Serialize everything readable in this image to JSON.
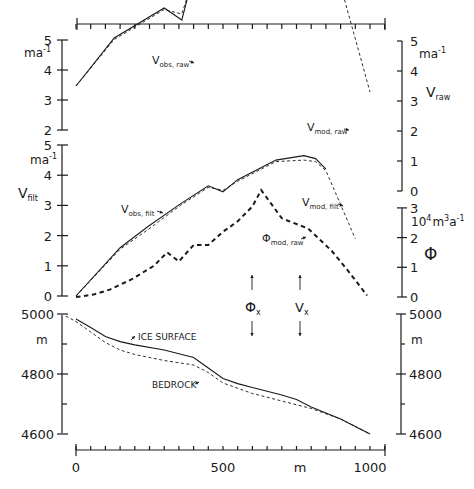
{
  "chart_data": [
    {
      "type": "line",
      "panel": "top",
      "ylabel": "V_raw",
      "yunit": "m a^-1",
      "left_ticks": [
        "5",
        "4",
        "3",
        "2"
      ],
      "right_ticks": [
        "5",
        "4",
        "3",
        "2",
        "1",
        "0"
      ],
      "left_ylim": [
        2,
        5
      ],
      "right_ylim": [
        0,
        5
      ],
      "xlim": [
        0,
        1050
      ],
      "series": [
        {
          "name": "V_obs,raw",
          "style": "solid",
          "x": [
            0,
            130,
            300,
            360,
            410,
            455,
            500,
            550,
            620,
            670,
            720,
            780,
            880
          ],
          "y": [
            3.5,
            5.1,
            6.1,
            5.7,
            7.6,
            6.9,
            6.6,
            7.0,
            8.05,
            7.6,
            7.9,
            8.35,
            7.3
          ]
        },
        {
          "name": "V_mod,raw",
          "style": "dashed",
          "x": [
            0,
            130,
            300,
            360,
            410,
            455,
            500,
            550,
            620,
            670,
            720,
            780,
            880,
            910,
            1000
          ],
          "y": [
            3.5,
            5.05,
            6.05,
            5.9,
            7.4,
            7.0,
            6.75,
            6.95,
            7.8,
            7.75,
            7.85,
            8.2,
            7.25,
            6.5,
            3.3
          ]
        }
      ],
      "annotations": [
        "V_obs,raw",
        "V_mod,raw",
        "V_raw"
      ]
    },
    {
      "type": "line",
      "panel": "middle",
      "ylabel": "V_filt",
      "yunit": "m a^-1",
      "left_ticks": [
        "5",
        "4",
        "3",
        "2",
        "1",
        "0"
      ],
      "left_ylim": [
        0,
        5
      ],
      "right_label": "Φ",
      "right_unit": "10^4 m^3 a^-1",
      "right_ticks": [
        "3",
        "2",
        "1",
        "0"
      ],
      "right_ylim": [
        0,
        3
      ],
      "xlim": [
        0,
        1050
      ],
      "series": [
        {
          "name": "V_obs,filt",
          "style": "solid",
          "axis": "left",
          "x": [
            0,
            150,
            245,
            355,
            450,
            500,
            550,
            680,
            775,
            815,
            850
          ],
          "y": [
            0,
            1.6,
            2.3,
            3.05,
            3.65,
            3.45,
            3.85,
            4.5,
            4.65,
            4.55,
            4.2
          ]
        },
        {
          "name": "V_mod,filt",
          "style": "dashed",
          "axis": "left",
          "x": [
            0,
            150,
            245,
            355,
            450,
            500,
            550,
            680,
            775,
            815,
            850,
            950
          ],
          "y": [
            0,
            1.55,
            2.2,
            3.0,
            3.6,
            3.5,
            3.8,
            4.45,
            4.5,
            4.45,
            4.15,
            1.9
          ]
        },
        {
          "name": "Φ_mod,raw",
          "style": "dashed-bold",
          "axis": "right",
          "x": [
            0,
            60,
            115,
            190,
            265,
            310,
            350,
            400,
            450,
            500,
            550,
            600,
            630,
            700,
            790,
            870,
            920,
            990
          ],
          "y": [
            0,
            0.08,
            0.25,
            0.6,
            1.05,
            1.5,
            1.2,
            1.75,
            1.75,
            2.2,
            2.55,
            3.05,
            3.6,
            2.65,
            2.3,
            1.55,
            0.95,
            0.05
          ]
        }
      ],
      "annotations": [
        "V_obs,filt",
        "V_mod,filt",
        "Φ_mod,raw",
        "Φ_x",
        "V_x"
      ],
      "markers": [
        {
          "label": "Φ_x",
          "x": 600
        },
        {
          "label": "V_x",
          "x": 760
        }
      ]
    },
    {
      "type": "line",
      "panel": "bottom",
      "ylabel": "",
      "yunit": "m",
      "left_ticks": [
        "5000",
        "4800",
        "4600"
      ],
      "right_ticks": [
        "5000",
        "4800",
        "4600"
      ],
      "ylim": [
        4600,
        5000
      ],
      "xlabel": "m",
      "x_ticks": [
        "0",
        "500",
        "1000"
      ],
      "xlim": [
        0,
        1050
      ],
      "series": [
        {
          "name": "ICE SURFACE",
          "style": "solid",
          "x": [
            0,
            50,
            100,
            150,
            200,
            300,
            400,
            450,
            500,
            550,
            600,
            700,
            750,
            800,
            900,
            1000
          ],
          "y": [
            4983,
            4955,
            4925,
            4908,
            4897,
            4880,
            4855,
            4820,
            4785,
            4768,
            4755,
            4730,
            4715,
            4690,
            4650,
            4600
          ]
        },
        {
          "name": "BEDROCK",
          "style": "dashed",
          "x": [
            -35,
            0,
            50,
            100,
            150,
            200,
            300,
            400,
            450,
            500,
            600,
            700,
            800,
            900,
            1000
          ],
          "y": [
            4993,
            4975,
            4940,
            4905,
            4880,
            4865,
            4845,
            4830,
            4805,
            4770,
            4735,
            4710,
            4685,
            4650,
            4600
          ]
        }
      ],
      "annotations": [
        "ICE SURFACE",
        "BEDROCK"
      ]
    }
  ],
  "labels": {
    "v_obs_raw": "V",
    "v_obs_raw_sub": "obs, raw",
    "v_mod_raw": "V",
    "v_mod_raw_sub": "mod, raw",
    "v_raw": "V",
    "v_raw_sub": "raw",
    "v_filt": "V",
    "v_filt_sub": "filt",
    "v_obs_filt": "V",
    "v_obs_filt_sub": "obs, filt",
    "v_mod_filt": "V",
    "v_mod_filt_sub": "mod, filt",
    "phi_mod_raw": "Φ",
    "phi_mod_raw_sub": "mod, raw",
    "phi": "Φ",
    "phi_x": "Φ",
    "phi_x_sub": "x",
    "v_x": "V",
    "v_x_sub": "x",
    "ice_surface": "ICE SURFACE",
    "bedrock": "BEDROCK",
    "unit_ma": "ma",
    "unit_ma_exp": "-1",
    "unit_flux": "10",
    "unit_flux_exp": "4",
    "unit_flux_m": "m",
    "unit_flux_m_exp": "3",
    "unit_flux_a": "a",
    "unit_flux_a_exp": "-1",
    "unit_m": "m",
    "x_unit": "m",
    "x_tick_0": "0",
    "x_tick_500": "500",
    "x_tick_1000": "1000"
  }
}
